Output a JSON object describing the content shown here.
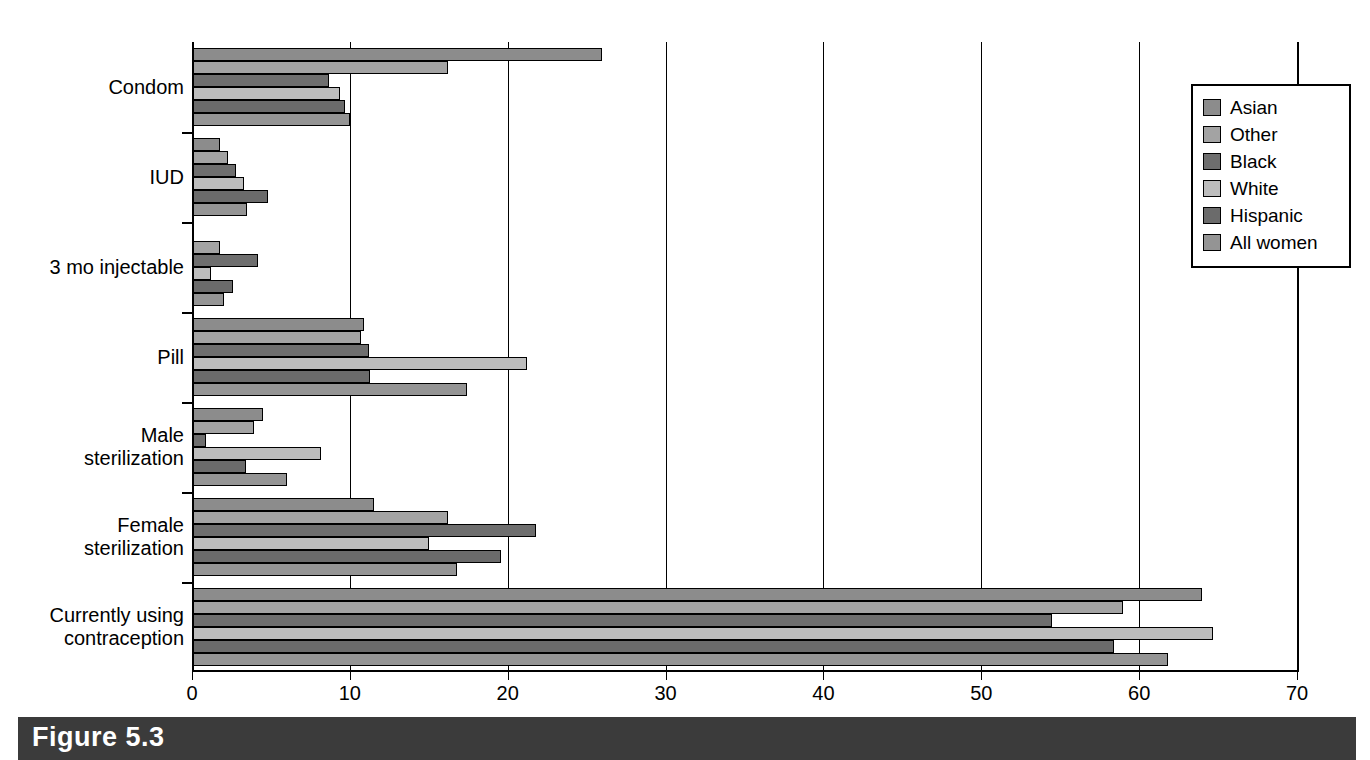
{
  "figure": {
    "caption": "Figure 5.3"
  },
  "chart_data": {
    "type": "bar",
    "orientation": "horizontal",
    "title": "",
    "subtitle": "",
    "xlabel": "",
    "ylabel": "",
    "xlim": [
      0,
      70
    ],
    "xticks": [
      0,
      10,
      20,
      30,
      40,
      50,
      60,
      70
    ],
    "xticklabels": [
      "0",
      "10",
      "20",
      "30",
      "40",
      "50",
      "60",
      "70"
    ],
    "grid": true,
    "grid_axis": "x",
    "legend_position": "right-top",
    "categories": [
      "Condom",
      "IUD",
      "3 mo injectable",
      "Pill",
      "Male\nsterilization",
      "Female\nsterilization",
      "Currently using\ncontraception"
    ],
    "series": [
      {
        "name": "Asian",
        "color": "#8c8c8c",
        "values": [
          26.0,
          1.8,
          0.0,
          10.9,
          4.5,
          11.5,
          64.0
        ]
      },
      {
        "name": "Other",
        "color": "#a3a3a3",
        "values": [
          16.2,
          2.3,
          1.8,
          10.7,
          3.9,
          16.2,
          59.0
        ]
      },
      {
        "name": "Black",
        "color": "#6e6e6e",
        "values": [
          8.7,
          2.8,
          4.2,
          11.2,
          0.9,
          21.8,
          54.5
        ]
      },
      {
        "name": "White",
        "color": "#bdbdbd",
        "values": [
          9.4,
          3.3,
          1.2,
          21.2,
          8.2,
          15.0,
          64.7
        ]
      },
      {
        "name": "Hispanic",
        "color": "#6b6b6b",
        "values": [
          9.7,
          4.8,
          2.6,
          11.3,
          3.4,
          19.6,
          58.4
        ]
      },
      {
        "name": "All women",
        "color": "#949494",
        "values": [
          10.0,
          3.5,
          2.0,
          17.4,
          6.0,
          16.8,
          61.8
        ]
      }
    ]
  },
  "legend": {
    "entries": [
      {
        "label": "Asian"
      },
      {
        "label": "Other"
      },
      {
        "label": "Black"
      },
      {
        "label": "White"
      },
      {
        "label": "Hispanic"
      },
      {
        "label": "All women"
      }
    ]
  }
}
